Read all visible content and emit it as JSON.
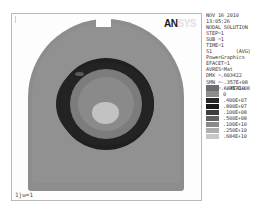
{
  "app": {
    "vendor_logo": "AN",
    "vendor_logo_ghost": "SYS"
  },
  "plot": {
    "job_label": "1jw=1",
    "model_shape": "dome-with-top-notch"
  },
  "info": {
    "lines": [
      "NOV 16 2010",
      "13:05:26",
      "NODAL SOLUTION",
      "STEP=1",
      "SUB =1",
      "TIME=1",
      "S1        (AVG)",
      "PowerGraphics",
      "EFACET=1",
      "AVRES=Mat",
      "DMX =.603422",
      "SMN =-.357E+08",
      "SMX =.684E+10"
    ]
  },
  "legend": {
    "entries": [
      {
        "label": "-.357E+08",
        "color": "#6e6e6e"
      },
      {
        "label": "0",
        "color": "#8d8d8d"
      },
      {
        "label": ".400E+07",
        "color": "#262626"
      },
      {
        "label": ".800E+07",
        "color": "#1b1b1b"
      },
      {
        "label": ".100E+08",
        "color": "#3d3d3d"
      },
      {
        "label": ".500E+08",
        "color": "#616161"
      },
      {
        "label": ".100E+10",
        "color": "#8a8a8a"
      },
      {
        "label": ".250E+10",
        "color": "#aeaeae"
      },
      {
        "label": ".684E+10",
        "color": "#c8c8c8"
      }
    ]
  },
  "chart_data": {
    "type": "heatmap",
    "title": "NODAL SOLUTION",
    "subtitle": "S1 (AVG)",
    "xlabel": "",
    "ylabel": "",
    "colorbar_label": "S1",
    "colorbar_ticks": [
      "-.357E+08",
      "0",
      ".400E+07",
      ".800E+07",
      ".100E+08",
      ".500E+08",
      ".100E+10",
      ".250E+10",
      ".684E+10"
    ],
    "vmin": -35700000,
    "vmax": 6840000000,
    "dmx": 0.603422,
    "smn": -35700000,
    "smx": 6840000000,
    "colormap": "greyscale",
    "grid": false,
    "legend_position": "right",
    "solution": {
      "step": 1,
      "sub": 1,
      "time": 1,
      "result_item": "S1",
      "averaging": "AVG",
      "graphics_mode": "PowerGraphics",
      "efacet": 1,
      "avres": "Mat"
    },
    "timestamp": {
      "date": "NOV 16 2010",
      "time": "13:05:26"
    }
  }
}
